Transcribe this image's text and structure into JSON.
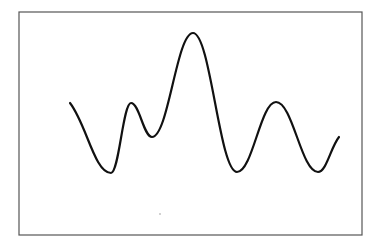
{
  "chart_data": {
    "type": "line",
    "title": "",
    "xlabel": "",
    "ylabel": "",
    "grid": false,
    "legend": null,
    "frame": {
      "x": 19,
      "y": 12,
      "width": 343,
      "height": 223
    },
    "line_color": "#111111",
    "frame_color": "#555555",
    "series": [
      {
        "name": "waveform",
        "points": [
          [
            70,
            103
          ],
          [
            111,
            173
          ],
          [
            131,
            103
          ],
          [
            152,
            137
          ],
          [
            193,
            33
          ],
          [
            237,
            172
          ],
          [
            276,
            102
          ],
          [
            318,
            172
          ],
          [
            339,
            137
          ]
        ]
      }
    ]
  }
}
